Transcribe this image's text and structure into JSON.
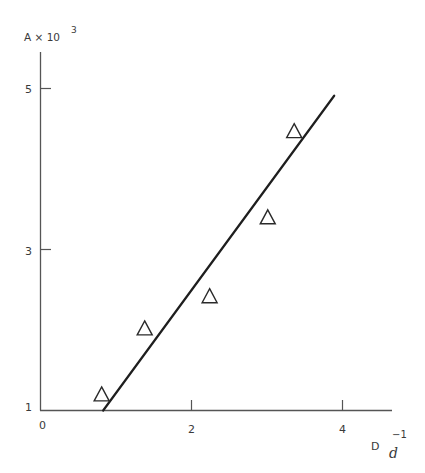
{
  "chart_data": {
    "type": "scatter",
    "title": "",
    "xlabel": "D d^-1",
    "ylabel": "A × 10^3",
    "xlim": [
      0,
      4.7
    ],
    "ylim": [
      1,
      5.8
    ],
    "grid": false,
    "legend": null,
    "x_ticks": [
      0,
      2,
      4
    ],
    "y_ticks": [
      1,
      3,
      5
    ],
    "series": [
      {
        "name": "observed",
        "marker": "open-triangle",
        "points": [
          {
            "x": 0.81,
            "y": 1.2
          },
          {
            "x": 1.38,
            "y": 2.02
          },
          {
            "x": 2.24,
            "y": 2.42
          },
          {
            "x": 3.01,
            "y": 3.4
          },
          {
            "x": 3.36,
            "y": 4.47
          }
        ]
      },
      {
        "name": "fitted line",
        "type": "line",
        "points": [
          {
            "x": 0.83,
            "y": 1.0
          },
          {
            "x": 3.89,
            "y": 4.91
          }
        ]
      }
    ]
  },
  "labels": {
    "y_axis_main": "A × 10",
    "y_axis_exp": "3",
    "x_axis_main": "D",
    "x_axis_var": "d",
    "x_axis_exp": "−1",
    "x_ticks": [
      "0",
      "2",
      "4"
    ],
    "y_ticks": [
      "1",
      "3",
      "5"
    ]
  }
}
